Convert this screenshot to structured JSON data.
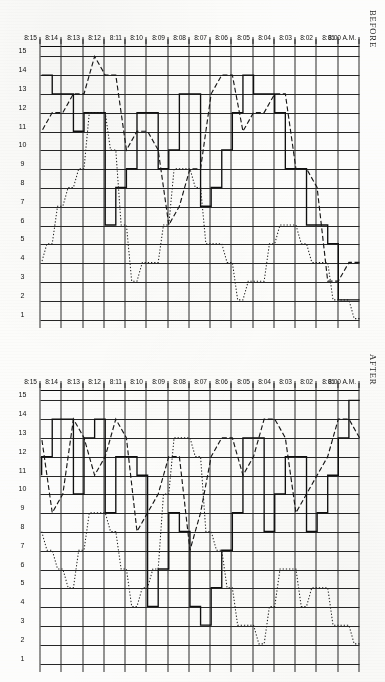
{
  "figure": {
    "orientation": "rotated-90",
    "panels": [
      {
        "key": "before",
        "title": "BEFORE"
      },
      {
        "key": "after",
        "title": "AFTER"
      }
    ],
    "value_axis": {
      "label": "",
      "ticks": [
        "15",
        "14",
        "13",
        "12",
        "11",
        "10",
        "9",
        "8",
        "7",
        "6",
        "5",
        "4",
        "3",
        "2",
        "1"
      ],
      "min": 1,
      "max": 15
    },
    "time_axis": {
      "origin_label": "8:00 A.M.",
      "ticks": [
        "8:00 A.M.",
        "8:01",
        "8:02",
        "8:03",
        "8:04",
        "8:05",
        "8:06",
        "8:07",
        "8:08",
        "8:09",
        "8:10",
        "8:11",
        "8:12",
        "8:13",
        "8:14",
        "8:15"
      ],
      "start": 0,
      "end": 15
    },
    "ink_color": "#141414",
    "paper_color": "#fdfdfb"
  },
  "chart_data": [
    {
      "type": "line",
      "title": "BEFORE",
      "xlabel": "",
      "ylabel": "",
      "x": [
        0,
        0.5,
        1,
        1.5,
        2,
        2.5,
        3,
        3.5,
        4,
        4.5,
        5,
        5.5,
        6,
        6.5,
        7,
        7.5,
        8,
        8.5,
        9,
        9.5,
        10,
        10.5,
        11,
        11.5,
        12,
        12.5,
        13,
        13.5,
        14,
        14.5,
        15
      ],
      "xtick_labels": [
        "8:00 A.M.",
        "8:01",
        "8:02",
        "8:03",
        "8:04",
        "8:05",
        "8:06",
        "8:07",
        "8:08",
        "8:09",
        "8:10",
        "8:11",
        "8:12",
        "8:13",
        "8:14",
        "8:15"
      ],
      "ylim": [
        1,
        15
      ],
      "grid": true,
      "legend_position": "none",
      "series": [
        {
          "name": "solid",
          "style": "solid",
          "values": [
            2,
            2,
            5,
            6,
            6,
            9,
            9,
            12,
            13,
            13,
            14,
            12,
            10,
            8,
            7,
            13,
            13,
            10,
            9,
            12,
            12,
            9,
            8,
            6,
            12,
            12,
            11,
            13,
            13,
            14,
            14
          ]
        },
        {
          "name": "dashed",
          "style": "dashed",
          "values": [
            4,
            4,
            3,
            3,
            8,
            9,
            9,
            13,
            13,
            12,
            12,
            11,
            14,
            14,
            13,
            9,
            9,
            7,
            6,
            10,
            11,
            11,
            10,
            14,
            14,
            15,
            13,
            13,
            12,
            12,
            11
          ]
        },
        {
          "name": "dotted",
          "style": "dotted",
          "values": [
            1,
            2,
            2,
            4,
            4,
            5,
            6,
            6,
            5,
            3,
            3,
            2,
            4,
            5,
            5,
            8,
            9,
            9,
            6,
            4,
            4,
            3,
            6,
            10,
            12,
            12,
            9,
            8,
            7,
            5,
            4
          ]
        }
      ]
    },
    {
      "type": "line",
      "title": "AFTER",
      "xlabel": "",
      "ylabel": "",
      "x": [
        0,
        0.5,
        1,
        1.5,
        2,
        2.5,
        3,
        3.5,
        4,
        4.5,
        5,
        5.5,
        6,
        6.5,
        7,
        7.5,
        8,
        8.5,
        9,
        9.5,
        10,
        10.5,
        11,
        11.5,
        12,
        12.5,
        13,
        13.5,
        14,
        14.5,
        15
      ],
      "xtick_labels": [
        "8:00 A.M.",
        "8:01",
        "8:02",
        "8:03",
        "8:04",
        "8:05",
        "8:06",
        "8:07",
        "8:08",
        "8:09",
        "8:10",
        "8:11",
        "8:12",
        "8:13",
        "8:14",
        "8:15"
      ],
      "ylim": [
        1,
        15
      ],
      "grid": true,
      "legend_position": "none",
      "series": [
        {
          "name": "solid",
          "style": "solid",
          "values": [
            15,
            13,
            11,
            9,
            8,
            12,
            12,
            10,
            8,
            13,
            13,
            9,
            7,
            5,
            3,
            4,
            8,
            9,
            6,
            4,
            11,
            12,
            12,
            9,
            14,
            13,
            10,
            14,
            14,
            12,
            11
          ]
        },
        {
          "name": "dashed",
          "style": "dashed",
          "values": [
            13,
            14,
            14,
            12,
            11,
            10,
            9,
            13,
            14,
            14,
            12,
            11,
            13,
            13,
            12,
            9,
            7,
            12,
            12,
            10,
            9,
            8,
            13,
            14,
            12,
            11,
            13,
            14,
            10,
            9,
            13
          ]
        },
        {
          "name": "dotted",
          "style": "dotted",
          "values": [
            2,
            3,
            3,
            5,
            5,
            4,
            6,
            6,
            4,
            2,
            3,
            3,
            5,
            7,
            8,
            12,
            13,
            13,
            10,
            6,
            5,
            4,
            6,
            8,
            9,
            9,
            7,
            5,
            6,
            7,
            8
          ]
        }
      ]
    }
  ]
}
